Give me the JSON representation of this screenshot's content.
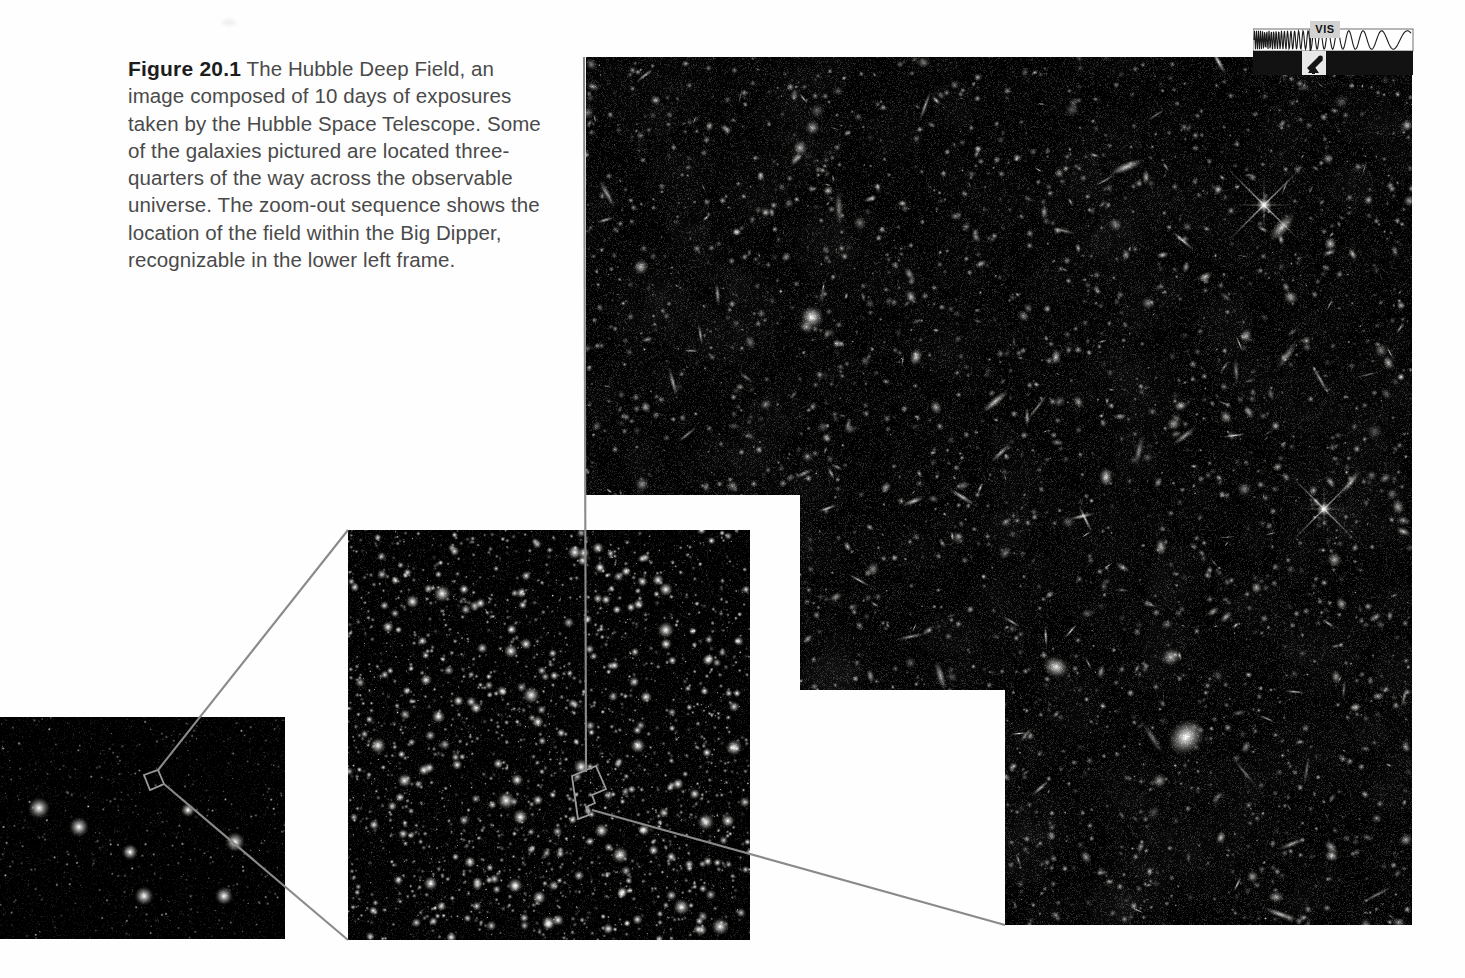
{
  "figure": {
    "label": "Figure 20.1",
    "caption": "The Hubble Deep Field, an image composed of 10 days of exposures taken by the Hubble Space Telescope. Some of the galaxies pictured are located three-quarters of the way across the observable universe. The zoom-out sequence shows the location of the field within the Big Dipper, recognizable in the lower left frame."
  },
  "spectrum_indicator": {
    "band_label": "VIS",
    "description": "electromagnetic spectrum strip with visible-light marker and telescope icon",
    "icon": "telescope-icon"
  },
  "panels": {
    "main": {
      "name": "Hubble Deep Field image",
      "shape": "stepped / notched footprint"
    },
    "middle": {
      "name": "wide star field"
    },
    "wide": {
      "name": "Big Dipper star field"
    }
  },
  "colors": {
    "page_background": "#fefefe",
    "sky": "#000000",
    "caption_label": "#1d1d1d",
    "caption_text": "#4a4a4a",
    "leader_line": "#8a8a8a",
    "vis_label_bg": "#d2d2d2"
  }
}
